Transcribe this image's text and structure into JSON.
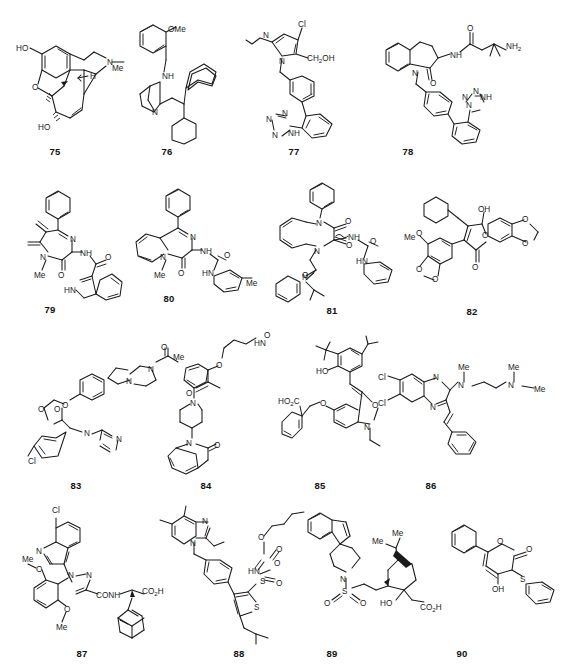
{
  "figure": {
    "kind": "chemical-structure-grid",
    "total_structures": 16,
    "columns": 4,
    "rows": 4,
    "background_color": "#ffffff",
    "line_color": "#1a1a1a",
    "label_style": "bold numeric caption below each structure"
  },
  "structures": [
    {
      "id": "75",
      "label": "75",
      "common_name": "morphine",
      "row": 1,
      "col": 1,
      "atom_labels": [
        "HO",
        "O",
        "N",
        "Me",
        "H",
        "HO"
      ],
      "features": [
        "fused pentacyclic morphinan",
        "phenol",
        "allylic alcohol",
        "furan ether bridge",
        "N-methyl",
        "stereo wedge bonds"
      ]
    },
    {
      "id": "76",
      "label": "76",
      "row": 1,
      "col": 2,
      "atom_labels": [
        "OMe",
        "NH",
        "N"
      ],
      "features": [
        "2-methoxybenzyl amine",
        "quinuclidine",
        "diphenylmethyl",
        "two phenyl rings"
      ]
    },
    {
      "id": "77",
      "label": "77",
      "common_name": "losartan",
      "row": 1,
      "col": 3,
      "atom_labels": [
        "Cl",
        "N",
        "N",
        "CH2OH",
        "N",
        "N",
        "N",
        "NH"
      ],
      "features": [
        "4-chloroimidazole",
        "n-butyl chain",
        "hydroxymethyl",
        "biphenyl",
        "tetrazole"
      ]
    },
    {
      "id": "78",
      "label": "78",
      "row": 1,
      "col": 4,
      "atom_labels": [
        "O",
        "NH",
        "NH2",
        "N",
        "O",
        "N",
        "N",
        "N",
        "NH"
      ],
      "features": [
        "benzazepinone lactam",
        "beta-amino amide with gem-dimethyl",
        "N-benzyl biphenyl",
        "tetrazole"
      ]
    },
    {
      "id": "79",
      "label": "79",
      "row": 2,
      "col": 1,
      "atom_labels": [
        "N",
        "NH",
        "O",
        "O",
        "Me",
        "HN"
      ],
      "features": [
        "1,4-diazepine-2-one core",
        "exocyclic methylenes",
        "phenyl at C5",
        "indole-3-carboxamide",
        "N-methyl"
      ]
    },
    {
      "id": "80",
      "label": "80",
      "common_name": "benzodiazepine urea",
      "row": 2,
      "col": 2,
      "atom_labels": [
        "N",
        "NH",
        "O",
        "O",
        "HN",
        "Me",
        "Me"
      ],
      "features": [
        "1,4-benzodiazepin-2-one",
        "5-phenyl",
        "3-ureido",
        "m-tolyl urea",
        "N1-methyl"
      ]
    },
    {
      "id": "81",
      "label": "81",
      "row": 2,
      "col": 3,
      "atom_labels": [
        "N",
        "O",
        "NH",
        "O",
        "HN",
        "N",
        "O"
      ],
      "features": [
        "1,5-benzodiazepine-2,4-dione",
        "N1-phenyl",
        "3-phenylurea with wavy stereo bond",
        "N5-CH2-C(=O)-N(phenyl)(isobutyl)"
      ]
    },
    {
      "id": "82",
      "label": "82",
      "row": 2,
      "col": 4,
      "atom_labels": [
        "OH",
        "O",
        "O",
        "O",
        "Me",
        "O",
        "O",
        "O",
        "O"
      ],
      "features": [
        "butenolide / furanone",
        "cyclohexylmethyl",
        "1,4-benzodioxane",
        "methoxy methylenedioxy aryl"
      ]
    },
    {
      "id": "83",
      "label": "83",
      "common_name": "ketoconazole analogue",
      "row": 3,
      "col": 1,
      "atom_labels": [
        "O",
        "Me",
        "N",
        "N",
        "O",
        "O",
        "O",
        "N",
        "N",
        "Cl"
      ],
      "features": [
        "1,3-dioxolane ketal",
        "4-chlorophenyl",
        "imidazole CH2",
        "aryl ether",
        "N-acetylpiperazine"
      ]
    },
    {
      "id": "84",
      "label": "84",
      "row": 3,
      "col": 2,
      "atom_labels": [
        "HN",
        "O",
        "O",
        "O",
        "N",
        "N",
        "O"
      ],
      "features": [
        "acetamido butoxy chain",
        "benzoyl piperidine",
        "3,4-dihydroquinolin-2(1H)-one"
      ]
    },
    {
      "id": "85",
      "label": "85",
      "common_name": "tyrphostin-type oxindole",
      "row": 3,
      "col": 3,
      "atom_labels": [
        "HO",
        "O",
        "O",
        "N",
        "HO2C"
      ],
      "features": [
        "3,5-di-tert-butyl-4-hydroxybenzylidene",
        "oxindole",
        "N-ethyl",
        "5-benzyloxy with benzoic acid"
      ]
    },
    {
      "id": "86",
      "label": "86",
      "row": 3,
      "col": 4,
      "atom_labels": [
        "Cl",
        "Cl",
        "N",
        "N",
        "Me",
        "N",
        "Me",
        "N",
        "Me"
      ],
      "features": [
        "6,7-dichloroquinoxaline",
        "N-methyl-N-(3-dimethylaminopropyl)amine",
        "trans-styryl"
      ]
    },
    {
      "id": "87",
      "label": "87",
      "row": 4,
      "col": 1,
      "atom_labels": [
        "Cl",
        "N",
        "Me",
        "O",
        "N",
        "N",
        "CONH",
        "CO2H",
        "O",
        "Me"
      ],
      "features": [
        "7-chloroquinoline",
        "pyrazole-3-carboxamide",
        "2,6-dimethoxyphenyl",
        "adamantyl glycine acid",
        "wedge stereocenter"
      ]
    },
    {
      "id": "88",
      "label": "88",
      "row": 4,
      "col": 2,
      "atom_labels": [
        "N",
        "N",
        "O",
        "O",
        "HN",
        "O",
        "S",
        "O",
        "S"
      ],
      "features": [
        "5,7-dimethylimidazo[4,5-b]pyridine",
        "2-ethyl",
        "N-benzyl",
        "thiophene sulfonyl carbamate (butyl ester)",
        "isobutyl thiophene"
      ]
    },
    {
      "id": "89",
      "label": "89",
      "row": 4,
      "col": 3,
      "atom_labels": [
        "N",
        "S",
        "O",
        "O",
        "Me",
        "Me",
        "HO",
        "CO2H"
      ],
      "features": [
        "spiro[indene-piperidine]",
        "sulfonyl ethyl linker",
        "bornane / camphor-derived bicyclic",
        "hydroxy acetic acid",
        "bold wedge bridge"
      ]
    },
    {
      "id": "90",
      "label": "90",
      "row": 4,
      "col": 4,
      "atom_labels": [
        "O",
        "O",
        "S",
        "OH"
      ],
      "features": [
        "6-phenyl-2H-pyran-2-one",
        "4-hydroxy",
        "3-phenylthio"
      ]
    }
  ],
  "captions": [
    {
      "id": "75",
      "text": "75",
      "x": 53,
      "y": 150
    },
    {
      "id": "76",
      "text": "76",
      "x": 165,
      "y": 150
    },
    {
      "id": "77",
      "text": "77",
      "x": 292,
      "y": 150
    },
    {
      "id": "78",
      "text": "78",
      "x": 406,
      "y": 150
    },
    {
      "id": "79",
      "text": "79",
      "x": 48,
      "y": 308
    },
    {
      "id": "80",
      "text": "80",
      "x": 167,
      "y": 297
    },
    {
      "id": "81",
      "text": "81",
      "x": 330,
      "y": 309
    },
    {
      "id": "82",
      "text": "82",
      "x": 470,
      "y": 310
    },
    {
      "id": "83",
      "text": "83",
      "x": 74,
      "y": 484
    },
    {
      "id": "84",
      "text": "84",
      "x": 204,
      "y": 484
    },
    {
      "id": "85",
      "text": "85",
      "x": 318,
      "y": 484
    },
    {
      "id": "86",
      "text": "86",
      "x": 429,
      "y": 484
    },
    {
      "id": "87",
      "text": "87",
      "x": 80,
      "y": 652
    },
    {
      "id": "88",
      "text": "88",
      "x": 237,
      "y": 652
    },
    {
      "id": "89",
      "text": "89",
      "x": 330,
      "y": 652
    },
    {
      "id": "90",
      "text": "90",
      "x": 460,
      "y": 652
    }
  ]
}
